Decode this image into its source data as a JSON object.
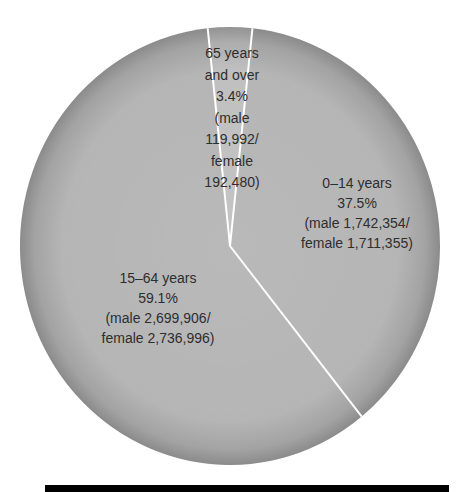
{
  "chart_data": {
    "type": "pie",
    "title": "",
    "start_angle_deg": -6.1,
    "direction": "clockwise",
    "slices": [
      {
        "name": "0–14 years",
        "percent": 37.5,
        "male": "1,742,354",
        "female": "1,711,355",
        "label_lines": [
          "0–14 years",
          "37.5%",
          "(male 1,742,354/",
          "female 1,711,355)"
        ],
        "color": "#b9b9b9"
      },
      {
        "name": "15–64 years",
        "percent": 59.1,
        "male": "2,699,906",
        "female": "2,736,996",
        "label_lines": [
          "15–64 years",
          "59.1%",
          "(male 2,699,906/",
          "female 2,736,996)"
        ],
        "color": "#b9b9b9"
      },
      {
        "name": "65 years and over",
        "percent": 3.4,
        "male": "119,992",
        "female": "192,480",
        "label_lines": [
          "65 years",
          "and over",
          "3.4%",
          "(male",
          "119,992/",
          "female",
          "192,480)"
        ],
        "color": "#c4c4c4"
      }
    ],
    "separator_color": "#ffffff",
    "edge_color": "#8e8e8e",
    "label_color": "#2e2e2e"
  },
  "footer_bar": {
    "color": "#000000"
  }
}
